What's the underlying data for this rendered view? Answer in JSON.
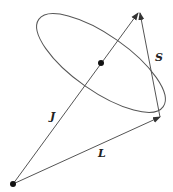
{
  "diagram": {
    "labels": {
      "J": "J",
      "S": "S",
      "L": "L"
    },
    "colors": {
      "line": "#555555",
      "dot": "#111111",
      "background": "#ffffff"
    },
    "elements": [
      {
        "type": "point",
        "name": "origin",
        "at": [
          13,
          184
        ]
      },
      {
        "type": "vector",
        "name": "J",
        "from": [
          13,
          184
        ],
        "to": [
          138,
          13
        ]
      },
      {
        "type": "vector",
        "name": "L",
        "from": [
          13,
          184
        ],
        "to": [
          160,
          117
        ]
      },
      {
        "type": "vector",
        "name": "S",
        "from": [
          160,
          117
        ],
        "to": [
          140,
          13
        ]
      },
      {
        "type": "point",
        "name": "precession-center",
        "at": [
          101,
          63
        ]
      },
      {
        "type": "ellipse",
        "name": "precession-cone"
      }
    ]
  }
}
